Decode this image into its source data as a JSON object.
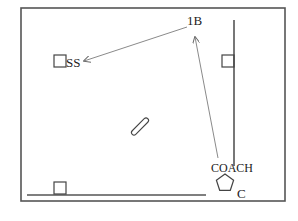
{
  "diagram": {
    "title": "",
    "labels": {
      "ss": "SS",
      "first_base": "1B",
      "coach": "COACH",
      "c": "C"
    },
    "colors": {
      "frame": "#555555",
      "line": "#555555",
      "arrow": "#8a8a8a",
      "text": "#222222",
      "background": "#ffffff"
    },
    "elements": {
      "frame": {
        "x": 21,
        "y": 8,
        "width": 264,
        "height": 193
      },
      "right_vertical_line": {
        "x": 234,
        "y1": 20,
        "y2": 166
      },
      "right_square": {
        "x": 222,
        "y": 55,
        "size": 12
      },
      "bottom_line": {
        "x1": 27,
        "x2": 206,
        "y": 195
      },
      "bottom_square": {
        "x": 54,
        "y": 182,
        "size": 12
      },
      "ss_square": {
        "x": 54,
        "y": 55,
        "size": 12
      },
      "bat": {
        "cx": 140,
        "cy": 127,
        "length": 22,
        "angle": -45
      },
      "pentagon": {
        "cx": 225,
        "cy": 183,
        "r": 9
      },
      "arrows": [
        {
          "from": "1B",
          "to": "SS",
          "x1": 187,
          "y1": 27,
          "x2": 84,
          "y2": 61
        },
        {
          "from": "COACH",
          "to": "1B",
          "x1": 218,
          "y1": 158,
          "x2": 195,
          "y2": 37
        }
      ]
    }
  }
}
